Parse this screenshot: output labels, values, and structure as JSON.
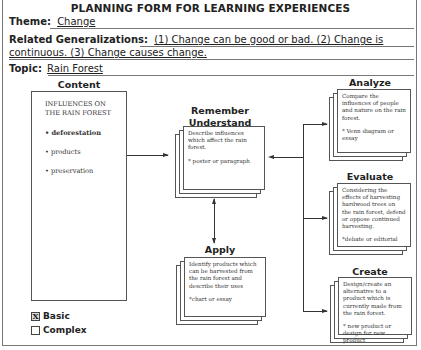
{
  "form": {
    "title": "PLANNING FORM FOR LEARNING EXPERIENCES",
    "theme_label": "Theme:",
    "theme_value": "Change",
    "generalizations_label": "Related Generalizations:",
    "generalizations_line1": "(1) Change can be good or bad.  (2) Change is",
    "generalizations_line2": "continuous.  (3) Change causes change.",
    "topic_label": "Topic:",
    "topic_value": "Rain Forest"
  },
  "content": {
    "label": "Content",
    "heading_line1": "INFLUENCES ON",
    "heading_line2": "THE RAIN FOREST",
    "items": [
      {
        "text": "• deforestation",
        "bold": true
      },
      {
        "text": "• products",
        "bold": false
      },
      {
        "text": "• preservation",
        "bold": false
      }
    ]
  },
  "remember": {
    "label_line1": "Remember",
    "label_line2": "Understand",
    "text": "Describe influences which affect the rain forest.",
    "note": "* poster or paragraph"
  },
  "apply": {
    "label": "Apply",
    "text": "Identify products which can be harvested from the rain forest and describe their uses",
    "note": "*chart or essay"
  },
  "analyze": {
    "label": "Analyze",
    "text": "Compare the influences of people and nature on the rain forest.",
    "note": "* Venn diagram or essay"
  },
  "evaluate": {
    "label": "Evaluate",
    "text": "Considering the effects of harvesting hardwood trees on the rain forest, defend or oppose continued harvesting.",
    "note": "*debate or editorial"
  },
  "create": {
    "label": "Create",
    "text": "Design/create an alternative to a product which is currently made from the rain forest.",
    "note": "* new product or design for new product"
  },
  "level": {
    "options": [
      {
        "label": "Basic",
        "checked": true,
        "mark": "X"
      },
      {
        "label": "Complex",
        "checked": false,
        "mark": ""
      }
    ]
  }
}
